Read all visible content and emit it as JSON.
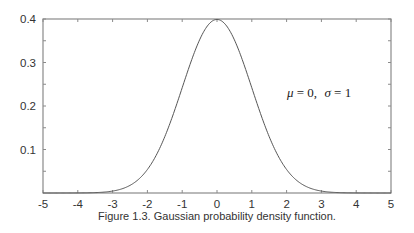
{
  "chart_data": {
    "type": "line",
    "title": "",
    "caption": "Figure 1.3. Gaussian probability density function.",
    "xlabel": "",
    "ylabel": "",
    "xlim": [
      -5,
      5
    ],
    "ylim": [
      0,
      0.4
    ],
    "x_ticks": [
      -5,
      -4,
      -3,
      -2,
      -1,
      0,
      1,
      2,
      3,
      4,
      5
    ],
    "x_tick_labels": [
      "-5",
      "-4",
      "-3",
      "-2",
      "-1",
      "0",
      "1",
      "2",
      "3",
      "4",
      "5"
    ],
    "y_ticks": [
      0.1,
      0.2,
      0.3,
      0.4
    ],
    "y_tick_labels": [
      "0.1",
      "0.2",
      "0.3",
      "0.4"
    ],
    "y_minor_ticks": [
      0.05,
      0.15,
      0.25,
      0.35
    ],
    "grid": false,
    "legend": null,
    "annotation": {
      "mu_symbol": "μ",
      "mu_value": "= 0,",
      "sigma_symbol": "σ",
      "sigma_value": "= 1",
      "x": 3.0,
      "y": 0.22
    },
    "series": [
      {
        "name": "Gaussian pdf (μ=0, σ=1)",
        "function": "exp(-x^2/2)/sqrt(2*pi)",
        "x": [
          -5,
          -4,
          -3,
          -2.5,
          -2,
          -1.5,
          -1,
          -0.5,
          0,
          0.5,
          1,
          1.5,
          2,
          2.5,
          3,
          4,
          5
        ],
        "values": [
          0.0,
          0.0001,
          0.0044,
          0.0175,
          0.054,
          0.1295,
          0.242,
          0.3521,
          0.3989,
          0.3521,
          0.242,
          0.1295,
          0.054,
          0.0175,
          0.0044,
          0.0001,
          0.0
        ]
      }
    ],
    "colors": {
      "axes": "#8a8a8a",
      "curve": "#555555",
      "text": "#333333"
    }
  }
}
